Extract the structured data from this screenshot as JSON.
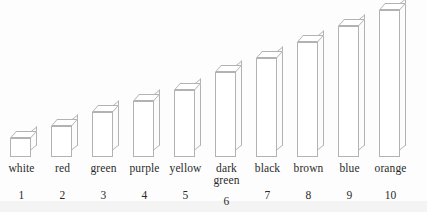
{
  "chart_data": {
    "type": "bar",
    "title": "",
    "subtitle": "",
    "xlabel": "",
    "ylabel": "",
    "grid": false,
    "legend": "none",
    "style": "3d-isometric-outline-bars",
    "categories": [
      "white",
      "red",
      "green",
      "purple",
      "yellow",
      "dark green",
      "black",
      "brown",
      "blue",
      "orange"
    ],
    "tick_labels": [
      "1",
      "2",
      "3",
      "4",
      "5",
      "6",
      "7",
      "8",
      "9",
      "10"
    ],
    "values": [
      19,
      31,
      45,
      56,
      67,
      85,
      99,
      115,
      131,
      147
    ],
    "ylim": [
      0,
      155
    ],
    "units": "pixels-above-baseline"
  },
  "bars": [
    {
      "index": 1,
      "name": "white",
      "name_lines": [
        "white"
      ],
      "number": "1",
      "height": 19
    },
    {
      "index": 2,
      "name": "red",
      "name_lines": [
        "red"
      ],
      "number": "2",
      "height": 31
    },
    {
      "index": 3,
      "name": "green",
      "name_lines": [
        "green"
      ],
      "number": "3",
      "height": 45
    },
    {
      "index": 4,
      "name": "purple",
      "name_lines": [
        "purple"
      ],
      "number": "4",
      "height": 56
    },
    {
      "index": 5,
      "name": "yellow",
      "name_lines": [
        "yellow"
      ],
      "number": "5",
      "height": 67
    },
    {
      "index": 6,
      "name": "dark green",
      "name_lines": [
        "dark",
        "green"
      ],
      "number": "6",
      "height": 85
    },
    {
      "index": 7,
      "name": "black",
      "name_lines": [
        "black"
      ],
      "number": "7",
      "height": 99
    },
    {
      "index": 8,
      "name": "brown",
      "name_lines": [
        "brown"
      ],
      "number": "8",
      "height": 115
    },
    {
      "index": 9,
      "name": "blue",
      "name_lines": [
        "blue"
      ],
      "number": "9",
      "height": 131
    },
    {
      "index": 10,
      "name": "orange",
      "name_lines": [
        "orange"
      ],
      "number": "10",
      "height": 147
    }
  ],
  "colors": {
    "background": "#ffffff",
    "bar_outline": "#b2b2b2",
    "bar_face": "#ffffff",
    "text": "#2b2b2b",
    "scan_tint": "#f4f4f5"
  },
  "layout": {
    "baseline_y": 157,
    "bar_pitch": 41,
    "first_bar_left": 1,
    "front_face_width": 21,
    "depth_offset": 6
  }
}
